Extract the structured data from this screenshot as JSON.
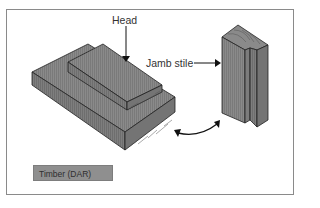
{
  "diagram": {
    "labels": {
      "head": "Head",
      "jamb_stile": "Jamb stile"
    },
    "legend": {
      "label": "Timber (DAR)",
      "swatch_color": "#8f8f8f"
    },
    "colors": {
      "timber_top": "#8c8c8c",
      "timber_side": "#7f7f7f",
      "timber_end": "#767676",
      "outline": "#222222",
      "frame_border": "#8a8a8a"
    },
    "elements": [
      "Head (two stacked timber boards)",
      "Jamb stile (rebated vertical timber)",
      "Curved double-headed arrow between components"
    ]
  }
}
